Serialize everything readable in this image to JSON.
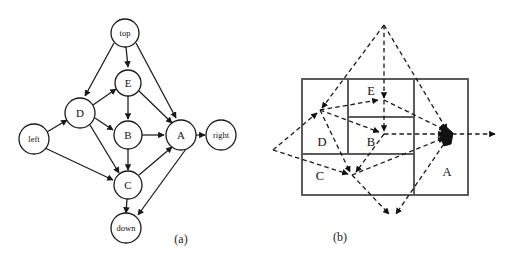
{
  "figure": {
    "background_color": "#ffffff",
    "ink_color": "#1a1a1a",
    "box_stroke_color": "#555555",
    "panels": [
      {
        "id": "panel-a",
        "caption": "(a)",
        "caption_pos": {
          "x": 181,
          "y": 240
        },
        "type": "directed-graph",
        "nodes": [
          {
            "id": "top",
            "label": "top",
            "x": 125,
            "y": 33,
            "r": 14,
            "label_size": "small"
          },
          {
            "id": "E",
            "label": "E",
            "x": 128,
            "y": 83,
            "r": 13,
            "label_size": "big"
          },
          {
            "id": "D",
            "label": "D",
            "x": 80,
            "y": 113,
            "r": 15,
            "label_size": "big"
          },
          {
            "id": "B",
            "label": "B",
            "x": 128,
            "y": 135,
            "r": 14,
            "label_size": "big"
          },
          {
            "id": "A",
            "label": "A",
            "x": 181,
            "y": 135,
            "r": 15,
            "label_size": "big"
          },
          {
            "id": "left",
            "label": "left",
            "x": 34,
            "y": 139,
            "r": 15,
            "label_size": "small"
          },
          {
            "id": "right",
            "label": "right",
            "x": 221,
            "y": 135,
            "r": 15,
            "label_size": "small"
          },
          {
            "id": "C",
            "label": "C",
            "x": 128,
            "y": 185,
            "r": 14,
            "label_size": "big"
          },
          {
            "id": "down",
            "label": "down",
            "x": 126,
            "y": 228,
            "r": 15,
            "label_size": "small"
          }
        ],
        "edges": [
          {
            "from": "top",
            "to": "E"
          },
          {
            "from": "top",
            "to": "D"
          },
          {
            "from": "top",
            "to": "A"
          },
          {
            "from": "E",
            "to": "B"
          },
          {
            "from": "E",
            "to": "A"
          },
          {
            "from": "D",
            "to": "E"
          },
          {
            "from": "D",
            "to": "B"
          },
          {
            "from": "D",
            "to": "C"
          },
          {
            "from": "B",
            "to": "A"
          },
          {
            "from": "B",
            "to": "C"
          },
          {
            "from": "left",
            "to": "D"
          },
          {
            "from": "left",
            "to": "C"
          },
          {
            "from": "A",
            "to": "right"
          },
          {
            "from": "C",
            "to": "A"
          },
          {
            "from": "C",
            "to": "down"
          },
          {
            "from": "A",
            "to": "down"
          }
        ]
      },
      {
        "id": "panel-b",
        "caption": "(b)",
        "caption_pos": {
          "x": 340,
          "y": 238
        },
        "type": "rectangle-layout",
        "boxes": [
          {
            "id": "outer",
            "x": 302,
            "y": 79,
            "w": 166,
            "h": 116,
            "label": ""
          },
          {
            "id": "D",
            "x": 302,
            "y": 79,
            "w": 46,
            "h": 75,
            "label": "D",
            "label_x": 322,
            "label_y": 143
          },
          {
            "id": "E",
            "x": 348,
            "y": 79,
            "w": 66,
            "h": 38,
            "label": "E",
            "label_x": 371,
            "label_y": 92
          },
          {
            "id": "B",
            "x": 348,
            "y": 117,
            "w": 66,
            "h": 37,
            "label": "B",
            "label_x": 371,
            "label_y": 143
          },
          {
            "id": "C",
            "x": 302,
            "y": 154,
            "w": 112,
            "h": 41,
            "label": "C",
            "label_x": 320,
            "label_y": 177
          },
          {
            "id": "A",
            "x": 414,
            "y": 79,
            "w": 54,
            "h": 116,
            "label": "A",
            "label_x": 447,
            "label_y": 173
          }
        ],
        "anchors": {
          "top": {
            "x": 384,
            "y": 25
          },
          "left": {
            "x": 273,
            "y": 150
          },
          "right": {
            "x": 497,
            "y": 134
          },
          "down": {
            "x": 391,
            "y": 218
          },
          "D": {
            "x": 320,
            "y": 110
          },
          "E": {
            "x": 384,
            "y": 100
          },
          "B": {
            "x": 384,
            "y": 134
          },
          "C": {
            "x": 352,
            "y": 175
          },
          "A": {
            "x": 448,
            "y": 134
          }
        },
        "edges": [
          {
            "from": "top",
            "to": "D"
          },
          {
            "from": "top",
            "to": "E"
          },
          {
            "from": "top",
            "to": "A"
          },
          {
            "from": "E",
            "to": "B"
          },
          {
            "from": "E",
            "to": "A"
          },
          {
            "from": "D",
            "to": "E"
          },
          {
            "from": "D",
            "to": "B"
          },
          {
            "from": "D",
            "to": "C"
          },
          {
            "from": "B",
            "to": "A"
          },
          {
            "from": "B",
            "to": "C"
          },
          {
            "from": "left",
            "to": "D"
          },
          {
            "from": "left",
            "to": "C"
          },
          {
            "from": "A",
            "to": "right"
          },
          {
            "from": "C",
            "to": "A"
          },
          {
            "from": "C",
            "to": "down"
          },
          {
            "from": "A",
            "to": "down"
          }
        ]
      }
    ]
  }
}
